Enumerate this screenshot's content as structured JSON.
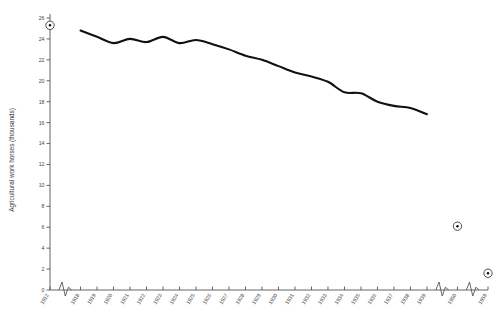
{
  "chart_data": {
    "type": "line",
    "title": "",
    "xlabel": "",
    "ylabel": "Agricultural work horses (thousands)",
    "ylim": [
      0,
      26
    ],
    "grid": false,
    "legend": false,
    "y_ticks": [
      0,
      2,
      4,
      6,
      8,
      10,
      12,
      14,
      16,
      18,
      20,
      22,
      24,
      26
    ],
    "x_tick_labels": [
      "1912",
      "1918",
      "1919",
      "1920",
      "1921",
      "1922",
      "1923",
      "1924",
      "1925",
      "1926",
      "1927",
      "1928",
      "1929",
      "1930",
      "1931",
      "1932",
      "1933",
      "1934",
      "1935",
      "1936",
      "1937",
      "1938",
      "1939",
      "1950",
      "1959"
    ],
    "axis_breaks_after": [
      "1912",
      "1939",
      "1950"
    ],
    "series": [
      {
        "name": "Agricultural work horses",
        "style": "line",
        "categories": [
          "1918",
          "1919",
          "1920",
          "1921",
          "1922",
          "1923",
          "1924",
          "1925",
          "1926",
          "1927",
          "1928",
          "1929",
          "1930",
          "1931",
          "1932",
          "1933",
          "1934",
          "1935",
          "1936",
          "1937",
          "1938",
          "1939"
        ],
        "values": [
          24.8,
          24.2,
          23.6,
          24.0,
          23.7,
          24.2,
          23.6,
          23.9,
          23.5,
          23.0,
          22.4,
          22.0,
          21.4,
          20.8,
          20.4,
          19.9,
          18.9,
          18.8,
          18.0,
          17.6,
          17.4,
          16.8
        ]
      },
      {
        "name": "Isolated observations",
        "style": "marker",
        "categories": [
          "1912",
          "1950",
          "1959"
        ],
        "values": [
          25.3,
          6.1,
          1.6
        ]
      }
    ]
  },
  "axes": {
    "y_axis_title": "Agricultural work horses (thousands)"
  },
  "colors": {
    "line": "#111111",
    "axis": "#555555",
    "text": "#444444",
    "background": "#ffffff"
  }
}
